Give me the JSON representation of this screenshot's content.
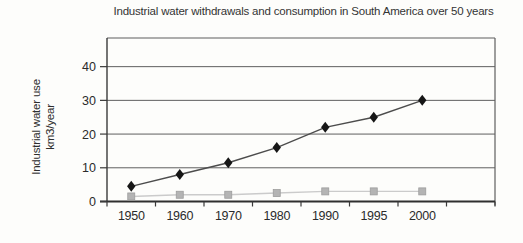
{
  "page": {
    "background": "#fdfdfb"
  },
  "chart": {
    "title": "Industrial water withdrawals and consumption in South America over 50 years",
    "y_axis_label_line1": "Industrial water use",
    "y_axis_label_line2": "km3/year"
  },
  "chart_data": {
    "type": "line",
    "title": "Industrial water withdrawals and consumption in South America over 50 years",
    "xlabel": "",
    "ylabel": "Industrial water use km3/year",
    "categories": [
      "1950",
      "1960",
      "1970",
      "1980",
      "1990",
      "1995",
      "2000"
    ],
    "series": [
      {
        "name": "Industrial water withdrawals",
        "marker": "diamond",
        "marker_color": "#161616",
        "line_color": "#4c4c4c",
        "values": [
          4.5,
          8,
          11.5,
          16,
          22,
          25,
          30
        ]
      },
      {
        "name": "Industrial water consumption",
        "marker": "square",
        "marker_color": "#b4b4b4",
        "marker_edge_color": "#9d9d9d",
        "line_color": "#cbcbcb",
        "values": [
          1.5,
          2,
          2,
          2.5,
          3,
          3,
          3
        ]
      }
    ],
    "yticks": [
      0,
      10,
      20,
      30,
      40
    ],
    "ylim": [
      0,
      48.5
    ],
    "grid": "horizontal-only",
    "legend": "none",
    "frame": true,
    "axis_color": "#3a3a3a",
    "grid_color": "#5f5f5f",
    "text_color": "#2b2b2b"
  }
}
